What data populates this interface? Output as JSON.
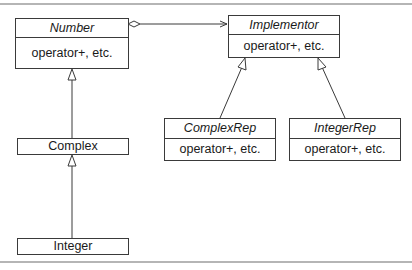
{
  "diagram": {
    "type": "UML class diagram (Bridge pattern)",
    "classes": [
      {
        "id": "number",
        "name": "Number",
        "abstract": true,
        "members": "operator+, etc."
      },
      {
        "id": "implementor",
        "name": "Implementor",
        "abstract": true,
        "members": "operator+, etc."
      },
      {
        "id": "complexrep",
        "name": "ComplexRep",
        "abstract": true,
        "members": "operator+, etc."
      },
      {
        "id": "integerrep",
        "name": "IntegerRep",
        "abstract": true,
        "members": "operator+, etc."
      },
      {
        "id": "complex",
        "name": "Complex",
        "abstract": false
      },
      {
        "id": "integer",
        "name": "Integer",
        "abstract": false
      }
    ],
    "relationships": [
      {
        "type": "aggregation",
        "from": "Number",
        "to": "Implementor",
        "navigable": true
      },
      {
        "type": "generalization",
        "from": "Complex",
        "to": "Number"
      },
      {
        "type": "generalization",
        "from": "Integer",
        "to": "Complex"
      },
      {
        "type": "generalization",
        "from": "ComplexRep",
        "to": "Implementor"
      },
      {
        "type": "generalization",
        "from": "IntegerRep",
        "to": "Implementor"
      }
    ]
  }
}
